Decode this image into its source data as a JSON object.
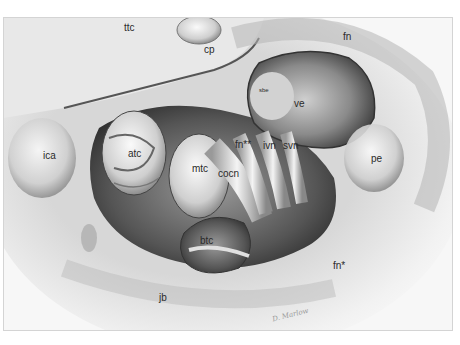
{
  "figure": {
    "labels": [
      {
        "id": "ttc",
        "text": "ttc",
        "x": 120,
        "y": 22
      },
      {
        "id": "cp",
        "text": "cp",
        "x": 202,
        "y": 31
      },
      {
        "id": "fn-top",
        "text": "fn",
        "x": 341,
        "y": 18
      },
      {
        "id": "sbe",
        "text": "sbe",
        "x": 255,
        "y": 74
      },
      {
        "id": "ve",
        "text": "ve",
        "x": 291,
        "y": 86
      },
      {
        "id": "ica",
        "text": "ica",
        "x": 40,
        "y": 138
      },
      {
        "id": "atc",
        "text": "atc",
        "x": 124,
        "y": 135
      },
      {
        "id": "fn-double-star",
        "text": "fn**",
        "x": 233,
        "y": 126
      },
      {
        "id": "ivn",
        "text": "ivn",
        "x": 260,
        "y": 127
      },
      {
        "id": "svn",
        "text": "svn",
        "x": 280,
        "y": 127
      },
      {
        "id": "pe",
        "text": "pe",
        "x": 368,
        "y": 138
      },
      {
        "id": "mtc",
        "text": "mtc",
        "x": 190,
        "y": 151
      },
      {
        "id": "cocn",
        "text": "cocn",
        "x": 215,
        "y": 154
      },
      {
        "id": "btc",
        "text": "btc",
        "x": 198,
        "y": 219
      },
      {
        "id": "fn-star",
        "text": "fn*",
        "x": 331,
        "y": 246
      },
      {
        "id": "jb",
        "text": "jb",
        "x": 155,
        "y": 275
      }
    ],
    "signature": "D. Marlow",
    "colors": {
      "background": "#ffffff",
      "paper": "#f7f7f7",
      "shadow": "#3c3c3c",
      "mid": "#8a8a8a",
      "label": "#2a2a2a"
    }
  }
}
